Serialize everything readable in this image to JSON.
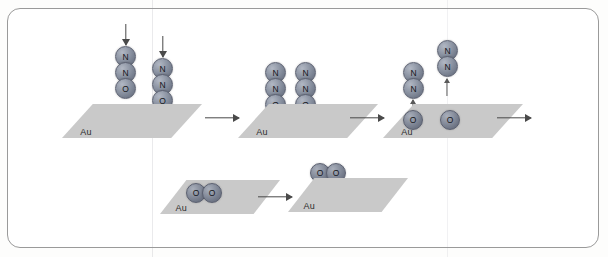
{
  "figure": {
    "type": "reaction-mechanism-schematic",
    "frame": {
      "border_color": "#9a9a9a",
      "background": "#ffffff"
    },
    "colors": {
      "slab_fill": "#c9c9c9",
      "atom_fill": "#8d95a4",
      "atom_border": "#5b6070",
      "arrow": "#4a4a4a",
      "label_text": "#2b2b2b"
    },
    "surface_label": "Au",
    "atom_labels": {
      "nitrogen": "N",
      "oxygen": "O"
    }
  },
  "top_row": {
    "step1": {
      "name": "incoming-n2o-molecules",
      "surface_label": "Au",
      "incoming_arrows": 2,
      "molecules": [
        {
          "name": "n2o-molecule-left",
          "atoms": [
            "N",
            "N",
            "O"
          ]
        },
        {
          "name": "n2o-molecule-right",
          "atoms": [
            "N",
            "N",
            "O"
          ]
        }
      ]
    },
    "step2": {
      "name": "adsorbed-n2o-molecules",
      "surface_label": "Au",
      "molecules": [
        {
          "name": "n2o-adsorbed-left",
          "atoms": [
            "N",
            "N",
            "O"
          ]
        },
        {
          "name": "n2o-adsorbed-right",
          "atoms": [
            "N",
            "N",
            "O"
          ]
        }
      ]
    },
    "step3": {
      "name": "dissociation-n2-desorption",
      "surface_label": "Au",
      "desorbing_molecules": [
        {
          "name": "n2-desorbing-left",
          "atoms": [
            "N",
            "N"
          ]
        },
        {
          "name": "n2-desorbing-right",
          "atoms": [
            "N",
            "N"
          ]
        }
      ],
      "surface_atoms": [
        {
          "name": "oxygen-adatom-left",
          "label": "O"
        },
        {
          "name": "oxygen-adatom-right",
          "label": "O"
        }
      ]
    }
  },
  "bottom_row": {
    "step4": {
      "name": "oxygen-adatoms-recombining",
      "surface_label": "Au",
      "surface_atoms": [
        {
          "name": "oxygen-adatom-left",
          "label": "O"
        },
        {
          "name": "oxygen-adatom-right",
          "label": "O"
        }
      ]
    },
    "step5": {
      "name": "o2-desorption",
      "surface_label": "Au",
      "desorbing_molecule": {
        "name": "o2-molecule",
        "atoms": [
          "O",
          "O"
        ]
      }
    }
  },
  "arrows": {
    "top_step1_to_step2": "→",
    "top_step2_to_step3": "→",
    "top_step3_to_exit": "→",
    "bottom_step4_to_step5": "→",
    "incoming_left": "↓",
    "incoming_right": "↓",
    "desorb_n2_left": "↑",
    "desorb_n2_right": "↑",
    "desorb_o2": "↑"
  }
}
